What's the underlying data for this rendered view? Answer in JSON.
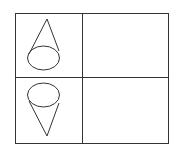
{
  "diagram": {
    "type": "table-grid",
    "rows": 2,
    "columns": 2,
    "cells": [
      {
        "row": 0,
        "col": 0,
        "content": "cone-apex-up-icon"
      },
      {
        "row": 0,
        "col": 1,
        "content": ""
      },
      {
        "row": 1,
        "col": 0,
        "content": "cone-apex-down-icon"
      },
      {
        "row": 1,
        "col": 1,
        "content": ""
      }
    ],
    "colors": {
      "line": "#333333",
      "background": "#ffffff"
    }
  }
}
